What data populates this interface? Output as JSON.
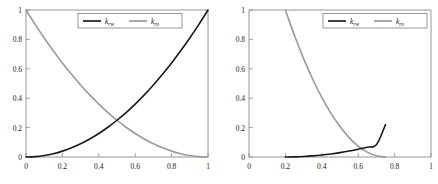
{
  "figure": {
    "background_color": "#ffffff",
    "panel_count": 2
  },
  "colors": {
    "krw": "#1a1a1a",
    "kro": "#9a9a9a",
    "axis": "#8a8a8a",
    "text": "#111111",
    "legend_border": "#7d7d7d"
  },
  "chart_data": [
    {
      "type": "line",
      "panel": "left",
      "title": "",
      "xlabel": "",
      "ylabel": "",
      "xlim": [
        0,
        1
      ],
      "ylim": [
        0,
        1
      ],
      "grid": false,
      "legend_position": "top-center",
      "xticks": [
        0,
        0.2,
        0.4,
        0.6,
        0.8,
        1
      ],
      "xticklabels": [
        "0",
        "0.2",
        "0.4",
        "0.6",
        "0.8",
        "1"
      ],
      "yticks": [
        0,
        0.2,
        0.4,
        0.6,
        0.8,
        1
      ],
      "yticklabels": [
        "0",
        "0.2",
        "0.4",
        "0.6",
        "0.8",
        "1"
      ],
      "series": [
        {
          "name": "k_rw",
          "label_main": "k",
          "label_sub": "rw",
          "color": "#1a1a1a",
          "x": [
            0,
            0.05,
            0.1,
            0.15,
            0.2,
            0.25,
            0.3,
            0.35,
            0.4,
            0.45,
            0.5,
            0.55,
            0.6,
            0.65,
            0.7,
            0.75,
            0.8,
            0.85,
            0.9,
            0.95,
            1
          ],
          "values": [
            0,
            0.0025,
            0.01,
            0.0225,
            0.04,
            0.0625,
            0.09,
            0.1225,
            0.16,
            0.2025,
            0.25,
            0.3025,
            0.36,
            0.4225,
            0.49,
            0.5625,
            0.64,
            0.7225,
            0.81,
            0.9025,
            1
          ]
        },
        {
          "name": "k_ro",
          "label_main": "k",
          "label_sub": "ro",
          "color": "#9a9a9a",
          "x": [
            0,
            0.05,
            0.1,
            0.15,
            0.2,
            0.25,
            0.3,
            0.35,
            0.4,
            0.45,
            0.5,
            0.55,
            0.6,
            0.65,
            0.7,
            0.75,
            0.8,
            0.85,
            0.9,
            0.95,
            1
          ],
          "values": [
            1,
            0.9025,
            0.81,
            0.7225,
            0.64,
            0.5625,
            0.49,
            0.4225,
            0.36,
            0.3025,
            0.25,
            0.2025,
            0.16,
            0.1225,
            0.09,
            0.0625,
            0.04,
            0.0225,
            0.01,
            0.0025,
            0
          ]
        }
      ],
      "annotations": [
        "curves intersect near (0.5, 0.25)"
      ]
    },
    {
      "type": "line",
      "panel": "right",
      "title": "",
      "xlabel": "",
      "ylabel": "",
      "xlim": [
        0,
        1
      ],
      "ylim": [
        0,
        1
      ],
      "grid": false,
      "legend_position": "top-right",
      "xticks": [
        0,
        0.2,
        0.4,
        0.6,
        0.8,
        1
      ],
      "xticklabels": [
        "0",
        "0.2",
        "0.4",
        "0.6",
        "0.8",
        "1"
      ],
      "yticks": [
        0,
        0.2,
        0.4,
        0.6,
        0.8,
        1
      ],
      "yticklabels": [
        "0",
        "0.2",
        "0.4",
        "0.6",
        "0.8",
        "1"
      ],
      "series": [
        {
          "name": "k_rw",
          "label_main": "k",
          "label_sub": "rw",
          "color": "#1a1a1a",
          "x": [
            0.2,
            0.25,
            0.3,
            0.35,
            0.4,
            0.45,
            0.5,
            0.55,
            0.6,
            0.65,
            0.7,
            0.75
          ],
          "values": [
            0,
            0.0008,
            0.0033,
            0.0074,
            0.0132,
            0.0207,
            0.0298,
            0.0405,
            0.0529,
            0.0669,
            0.0826,
            0.22
          ]
        },
        {
          "name": "k_ro",
          "label_main": "k",
          "label_sub": "ro",
          "color": "#9a9a9a",
          "x": [
            0.2,
            0.25,
            0.3,
            0.35,
            0.4,
            0.45,
            0.5,
            0.55,
            0.6,
            0.65,
            0.7,
            0.75
          ],
          "values": [
            1,
            0.826,
            0.669,
            0.529,
            0.405,
            0.298,
            0.207,
            0.132,
            0.074,
            0.033,
            0.008,
            0
          ]
        }
      ],
      "annotations": [
        "curves intersect near (0.61, 0.07)",
        "k_rw ends near (0.75, 0.22)"
      ]
    }
  ]
}
